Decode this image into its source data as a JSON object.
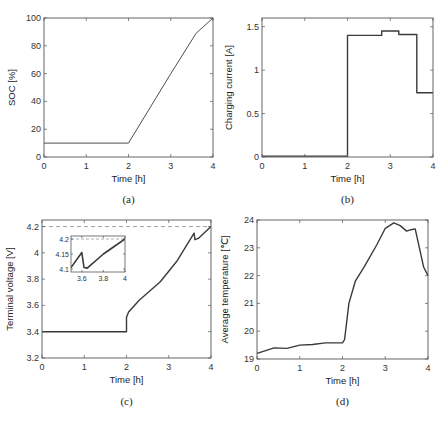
{
  "chart_data": [
    {
      "id": "a",
      "type": "line",
      "caption": "(a)",
      "title": "",
      "xlabel": "Time [h]",
      "ylabel": "SOC [%]",
      "xlim": [
        0,
        4
      ],
      "ylim": [
        0,
        100
      ],
      "xticks": [
        0,
        1,
        2,
        3,
        4
      ],
      "yticks": [
        0,
        20,
        40,
        60,
        80,
        100
      ],
      "grid": false,
      "series": [
        {
          "name": "SOC",
          "x": [
            0,
            2,
            2.6,
            3.0,
            3.6,
            4.0
          ],
          "y": [
            10,
            10,
            40,
            60,
            89,
            100
          ]
        }
      ]
    },
    {
      "id": "b",
      "type": "line",
      "caption": "(b)",
      "title": "",
      "xlabel": "Time [h]",
      "ylabel": "Charging current [A]",
      "xlim": [
        0,
        4
      ],
      "ylim": [
        0,
        1.6
      ],
      "xticks": [
        0,
        1,
        2,
        3,
        4
      ],
      "yticks": [
        0,
        0.5,
        1,
        1.5
      ],
      "ytick_labels": [
        "0",
        "0.5",
        "1",
        "1.5"
      ],
      "grid": false,
      "series": [
        {
          "name": "Charging current",
          "x": [
            0,
            2,
            2,
            2.8,
            2.8,
            3.2,
            3.2,
            3.62,
            3.62,
            4.0
          ],
          "y": [
            0.01,
            0.01,
            1.4,
            1.4,
            1.45,
            1.45,
            1.41,
            1.41,
            0.74,
            0.74
          ]
        }
      ]
    },
    {
      "id": "c",
      "type": "line",
      "caption": "(c)",
      "title": "",
      "xlabel": "Time [h]",
      "ylabel": "Terminal voltage [V]",
      "xlim": [
        0,
        4
      ],
      "ylim": [
        3.2,
        4.25
      ],
      "xticks": [
        0,
        1,
        2,
        3,
        4
      ],
      "yticks": [
        3.2,
        3.4,
        3.6,
        3.8,
        4.0,
        4.2
      ],
      "ytick_labels": [
        "3.2",
        "3.4",
        "3.6",
        "3.8",
        "4",
        "4.2"
      ],
      "grid": false,
      "reference_line": {
        "y": 4.2,
        "style": "dashed"
      },
      "series": [
        {
          "name": "Terminal voltage",
          "x": [
            0,
            2.0,
            2.0,
            2.05,
            2.3,
            2.8,
            3.2,
            3.6,
            3.62,
            3.7,
            4.0
          ],
          "y": [
            3.4,
            3.4,
            3.51,
            3.55,
            3.64,
            3.78,
            3.94,
            4.15,
            4.1,
            4.11,
            4.2
          ]
        }
      ],
      "inset": {
        "xlim": [
          3.5,
          4.0
        ],
        "ylim": [
          4.09,
          4.21
        ],
        "xticks": [
          3.6,
          3.8,
          4.0
        ],
        "xtick_labels": [
          "3.6",
          "3.8",
          "4"
        ],
        "yticks": [
          4.1,
          4.15,
          4.2
        ],
        "ytick_labels": [
          "4.1",
          "4.15",
          "4.2"
        ],
        "reference_line": {
          "y": 4.2,
          "style": "dashed"
        },
        "series": [
          {
            "name": "Terminal voltage (zoom)",
            "x": [
              3.5,
              3.6,
              3.62,
              3.65,
              3.8,
              4.0
            ],
            "y": [
              4.105,
              4.155,
              4.105,
              4.103,
              4.15,
              4.2
            ]
          }
        ]
      }
    },
    {
      "id": "d",
      "type": "line",
      "caption": "(d)",
      "title": "",
      "xlabel": "Time [h]",
      "ylabel": "Average temperature [℃]",
      "xlim": [
        0,
        4
      ],
      "ylim": [
        19,
        24
      ],
      "xticks": [
        0,
        1,
        2,
        3,
        4
      ],
      "yticks": [
        19,
        20,
        21,
        22,
        23,
        24
      ],
      "grid": false,
      "series": [
        {
          "name": "Average temperature",
          "x": [
            0,
            0.2,
            0.4,
            0.7,
            1.0,
            1.3,
            1.6,
            2.0,
            2.05,
            2.15,
            2.3,
            2.5,
            2.8,
            3.0,
            3.2,
            3.35,
            3.5,
            3.6,
            3.7,
            3.8,
            3.9,
            4.0
          ],
          "y": [
            19.2,
            19.3,
            19.4,
            19.38,
            19.5,
            19.52,
            19.58,
            19.58,
            19.7,
            21.0,
            21.8,
            22.3,
            23.1,
            23.7,
            23.9,
            23.8,
            23.6,
            23.65,
            23.68,
            23.0,
            22.3,
            22.0
          ]
        }
      ]
    }
  ]
}
